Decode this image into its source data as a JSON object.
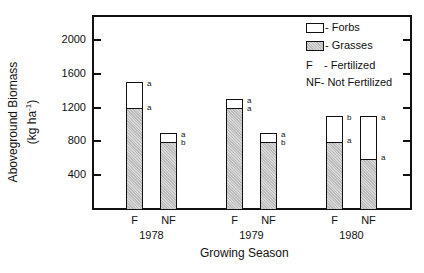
{
  "chart_data": {
    "type": "bar",
    "stacked": true,
    "title": "",
    "xlabel": "Growing Season",
    "ylabel": "Aboveground Biomass (kg ha-1)",
    "ylabel_line1": "Aboveground Biomass",
    "ylabel_line2": "(kg ha",
    "ylabel_sup": "-1",
    "ylabel_close": ")",
    "ylim": [
      0,
      2300
    ],
    "yticks": [
      "400",
      "800",
      "1200",
      "1600",
      "2000"
    ],
    "groups": [
      "1978",
      "1979",
      "1980"
    ],
    "categories": [
      "F",
      "NF",
      "F",
      "NF",
      "F",
      "NF"
    ],
    "series": [
      {
        "name": "Grasses",
        "values": [
          1200,
          800,
          1200,
          800,
          800,
          600
        ],
        "letters": [
          "a",
          "b",
          "a",
          "b",
          "a",
          "a"
        ]
      },
      {
        "name": "Forbs",
        "values": [
          300,
          100,
          100,
          100,
          300,
          500
        ],
        "letters": [
          "a",
          "a",
          "a",
          "a",
          "b",
          "a"
        ]
      }
    ],
    "totals": [
      1500,
      900,
      1300,
      900,
      1100,
      1100
    ],
    "legend": {
      "position": "upper right",
      "items": [
        {
          "swatch": "forbs",
          "label": "- Forbs"
        },
        {
          "swatch": "grasses",
          "label": "- Grasses"
        },
        {
          "key": "F",
          "label": "- Fertilized"
        },
        {
          "key": "NF",
          "label": "- Not Fertilized"
        }
      ]
    },
    "grid": false
  }
}
